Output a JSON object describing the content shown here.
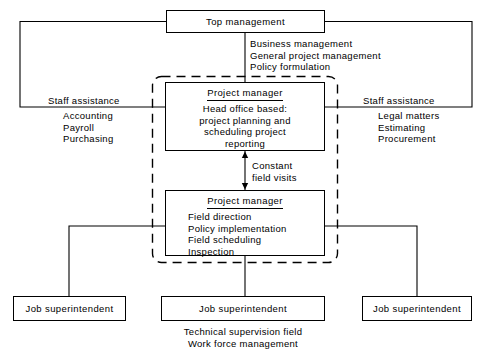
{
  "diagram": {
    "type": "organization-chart",
    "nodes": {
      "top_management": {
        "label": "Top management"
      },
      "head_office_project_manager": {
        "title": "Project manager",
        "lines": [
          "Head office based:",
          "project planning and",
          "scheduling project",
          "reporting"
        ]
      },
      "field_project_manager": {
        "title": "Project manager",
        "lines": [
          "Field direction",
          "Policy implementation",
          "Field scheduling",
          "Inspection"
        ]
      },
      "job_superintendent_left": {
        "label": "Job superintendent"
      },
      "job_superintendent_center": {
        "label": "Job superintendent"
      },
      "job_superintendent_right": {
        "label": "Job superintendent"
      }
    },
    "annotations": {
      "top_management_duties": [
        "Business management",
        "General project management",
        "Policy formulation"
      ],
      "staff_assistance_left": {
        "heading": "Staff assistance",
        "items": [
          "Accounting",
          "Payroll",
          "Purchasing"
        ]
      },
      "staff_assistance_right": {
        "heading": "Staff assistance",
        "items": [
          "Legal matters",
          "Estimating",
          "Procurement"
        ]
      },
      "constant_field_visits": [
        "Constant",
        "field visits"
      ],
      "job_superintendent_duties": [
        "Technical supervision field",
        "Work force management"
      ]
    },
    "colors": {
      "line": "#000000",
      "text": "#000000",
      "background": "#ffffff"
    }
  }
}
